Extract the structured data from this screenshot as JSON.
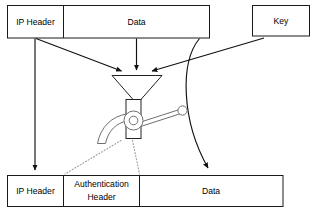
{
  "diagram": {
    "colors": {
      "line": "#111111",
      "box_stroke": "#1a1a1a",
      "dotted": "#9a9a9a",
      "valve_stroke": "#6f6f6f",
      "background": "#ffffff",
      "text": "#000000"
    },
    "input_row": {
      "packet_cells": [
        {
          "label": "IP Header"
        },
        {
          "label": "Data"
        }
      ],
      "key_box": {
        "label": "Key"
      }
    },
    "processor": {
      "icon_name": "funnel-valve-icon",
      "parts": [
        "funnel",
        "neck",
        "valve-hub",
        "valve-lever",
        "curved-spout"
      ]
    },
    "output_row": {
      "packet_cells": [
        {
          "label": "IP Header"
        },
        {
          "label": "Authentication Header",
          "line1": "Authentication",
          "line2": "Header"
        },
        {
          "label": "Data"
        }
      ]
    },
    "connectors": [
      {
        "name": "ip-header-passthrough-arrow",
        "from": "IP Header (top)",
        "to": "IP Header (bottom)",
        "style": "solid-arrow"
      },
      {
        "name": "ip-header-to-funnel-arrow",
        "from": "IP Header (top)",
        "to": "funnel",
        "style": "solid-arrow"
      },
      {
        "name": "data-to-funnel-arrow",
        "from": "Data (top)",
        "to": "funnel",
        "style": "solid-arrow"
      },
      {
        "name": "key-to-funnel-arrow",
        "from": "Key",
        "to": "funnel",
        "style": "solid-arrow"
      },
      {
        "name": "data-passthrough-curve-arrow",
        "from": "Data (top)",
        "to": "Data (bottom)",
        "style": "curved-arrow"
      },
      {
        "name": "auth-header-output-dotted-left",
        "from": "valve spout",
        "to": "Authentication Header (left edge)",
        "style": "dotted"
      },
      {
        "name": "auth-header-output-dotted-right",
        "from": "funnel neck",
        "to": "Authentication Header (right edge)",
        "style": "dotted"
      }
    ]
  }
}
